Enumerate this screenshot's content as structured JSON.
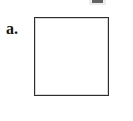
{
  "document": {
    "type": "worksheet-figure",
    "background_color": "#ffffff"
  },
  "figure": {
    "label": "a.",
    "label_style": "bold-serif",
    "label_color": "#141414",
    "shape": {
      "name": "square",
      "fill": "#ffffff",
      "stroke": "#2e2e2e",
      "stroke_width_px": 1,
      "content": ""
    }
  },
  "artifacts": {
    "top_smudge": {
      "description": "clipped dark mark at top edge",
      "color": "#4a4a4a"
    }
  }
}
